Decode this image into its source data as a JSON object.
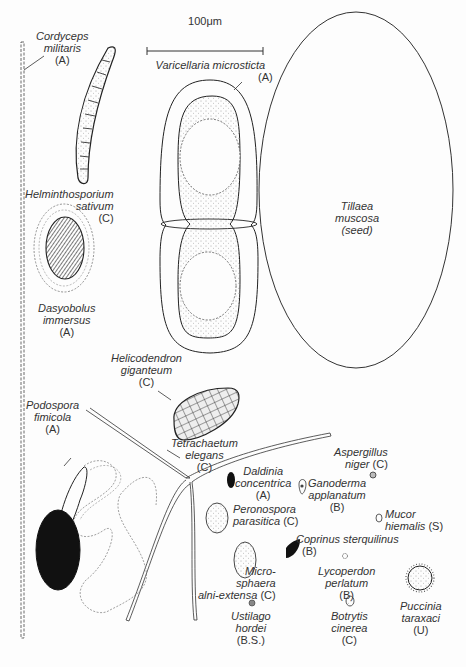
{
  "scale_bar": {
    "label": "100μm"
  },
  "specimens": [
    {
      "id": "cordyceps",
      "l1": "Cordyceps",
      "l2": "militaris",
      "group": "(A)"
    },
    {
      "id": "varicellaria",
      "l1": "Varicellaria microsticta",
      "l2": "",
      "group": "(A)"
    },
    {
      "id": "tillaea",
      "l1": "Tillaea",
      "l2": "muscosa",
      "group": "(seed)"
    },
    {
      "id": "helminthosporium",
      "l1": "Helminthosporium",
      "l2": "sativum",
      "group": "(C)"
    },
    {
      "id": "dasyobolus",
      "l1": "Dasyobolus",
      "l2": "immersus",
      "group": "(A)"
    },
    {
      "id": "helicodendron",
      "l1": "Helicodendron",
      "l2": "giganteum",
      "group": "(C)"
    },
    {
      "id": "podospora",
      "l1": "Podospora",
      "l2": "fimicola",
      "group": "(A)"
    },
    {
      "id": "tetrachaetum",
      "l1": "Tetrachaetum",
      "l2": "elegans",
      "group": "(C)"
    },
    {
      "id": "daldinia",
      "l1": "Daldinia",
      "l2": "concentrica",
      "group": "(A)"
    },
    {
      "id": "ganoderma",
      "l1": "Ganoderma",
      "l2": "applanatum",
      "group": "(B)"
    },
    {
      "id": "aspergillus",
      "l1": "Aspergillus",
      "l2": "niger",
      "group": "(C)"
    },
    {
      "id": "mucor",
      "l1": "Mucor",
      "l2": "hiemalis",
      "group": "(S)"
    },
    {
      "id": "peronospora",
      "l1": "Peronospora",
      "l2": "parasitica",
      "group": "(C)"
    },
    {
      "id": "coprinus",
      "l1": "Coprinus sterquilinus",
      "l2": "",
      "group": "(B)"
    },
    {
      "id": "microsphaera",
      "l1": "Micro-",
      "l2": "sphaera",
      "l3": "alni-extensa",
      "group": "(C)"
    },
    {
      "id": "lycoperdon",
      "l1": "Lycoperdon",
      "l2": "perlatum",
      "group": "(B)"
    },
    {
      "id": "ustilago",
      "l1": "Ustilago",
      "l2": "hordei",
      "group": "(B.S.)"
    },
    {
      "id": "botrytis",
      "l1": "Botrytis",
      "l2": "cinerea",
      "group": "(C)"
    },
    {
      "id": "puccinia",
      "l1": "Puccinia",
      "l2": "taraxaci",
      "group": "(U)"
    }
  ]
}
